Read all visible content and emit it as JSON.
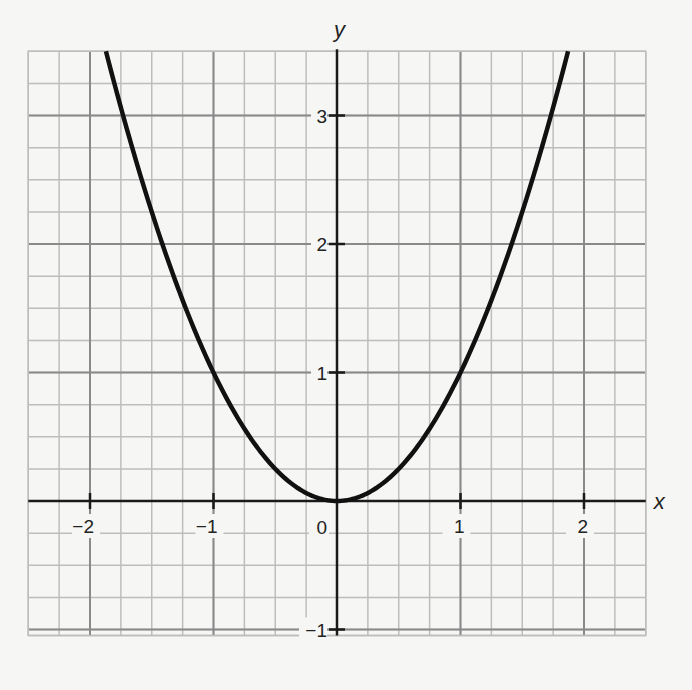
{
  "chart_data": {
    "type": "line",
    "title": "",
    "function": "y = x^2",
    "xlabel": "x",
    "ylabel": "y",
    "xlim": [
      -2.5,
      2.5
    ],
    "ylim": [
      -1.0,
      3.5
    ],
    "x_ticks": [
      -2,
      -1,
      0,
      1,
      2
    ],
    "y_ticks": [
      -1,
      1,
      2,
      3
    ],
    "x_tick_labels": [
      "−2",
      "−1",
      "0",
      "1",
      "2"
    ],
    "y_tick_labels": [
      "−1",
      "1",
      "2",
      "3"
    ],
    "minor_grid_step": 0.25,
    "major_grid_step": 1,
    "grid": true,
    "legend": null,
    "series": [
      {
        "name": "y = x^2",
        "x": [
          -1.87,
          -1.75,
          -1.5,
          -1.25,
          -1.0,
          -0.75,
          -0.5,
          -0.25,
          0,
          0.25,
          0.5,
          0.75,
          1.0,
          1.25,
          1.5,
          1.75,
          1.87
        ],
        "y": [
          3.5,
          3.0625,
          2.25,
          1.5625,
          1.0,
          0.5625,
          0.25,
          0.0625,
          0,
          0.0625,
          0.25,
          0.5625,
          1.0,
          1.5625,
          2.25,
          3.0625,
          3.5
        ]
      }
    ]
  },
  "labels": {
    "x_axis": "x",
    "y_axis": "y",
    "origin": "0"
  },
  "colors": {
    "background": "#f6f6f4",
    "minor_grid": "#bdbdbd",
    "major_grid": "#8a8a8a",
    "axis": "#1a1a1a",
    "curve": "#111111"
  }
}
